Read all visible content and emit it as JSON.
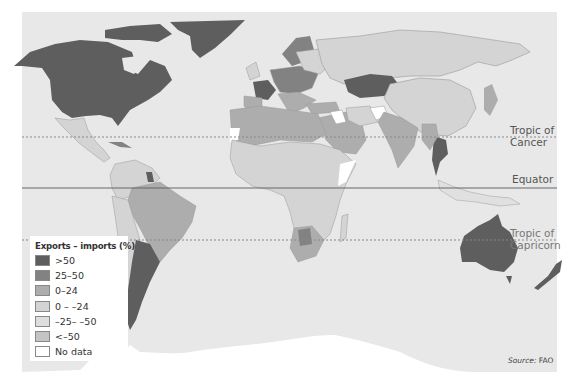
{
  "map": {
    "source_label": "Source:",
    "source_value": "FAO",
    "ocean_color": "#e8e8e8",
    "reference_lines": [
      {
        "label_line1": "Tropic of",
        "label_line2": "Cancer",
        "style": "dotted"
      },
      {
        "label_line1": "Equator",
        "style": "solid"
      },
      {
        "label_line1": "Tropic of",
        "label_line2": "Capricorn",
        "style": "dotted"
      }
    ]
  },
  "legend": {
    "title": "Exports – imports (%)",
    "items": [
      {
        "label": ">50",
        "color": "#5e5e5e"
      },
      {
        "label": "25–50",
        "color": "#828282"
      },
      {
        "label": "0–24",
        "color": "#adadad"
      },
      {
        "label": "0 – –24",
        "color": "#d4d4d4"
      },
      {
        "label": "–25– –50",
        "color": "#dedede"
      },
      {
        "label": "<–50",
        "color": "#c4c4c4"
      },
      {
        "label": "No data",
        "color": "#ffffff"
      }
    ]
  }
}
